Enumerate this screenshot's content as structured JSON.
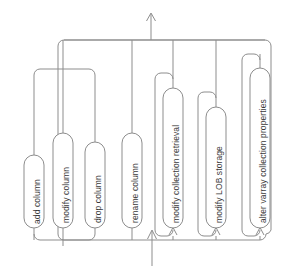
{
  "diagram": {
    "type": "railroad-syntax-diagram",
    "orientation": "vertical-rotated",
    "colors": {
      "line": "#8d8d8d",
      "node_fill": "#ffffff",
      "node_stroke": "#8d8d8d",
      "label_text": "#3a3a3a",
      "background": "#ffffff"
    },
    "entry": {
      "name": "entry-arrow",
      "direction": "up",
      "x": 152,
      "y_from": 266,
      "y_to": 229
    },
    "exit": {
      "name": "exit-arrow",
      "direction": "up",
      "x": 151,
      "y_from": 40,
      "y_to": 12
    },
    "nodes": [
      {
        "id": "add-column",
        "label": "add column",
        "x": 24,
        "y_top": 155,
        "y_bottom": 228,
        "width": 20,
        "rail_x": 34
      },
      {
        "id": "modify-column",
        "label": "modify column",
        "x": 53,
        "y_top": 133,
        "y_bottom": 228,
        "width": 20,
        "rail_x": 63
      },
      {
        "id": "drop-column",
        "label": "drop column",
        "x": 85,
        "y_top": 142,
        "y_bottom": 228,
        "width": 20,
        "rail_x": 95
      },
      {
        "id": "rename-column",
        "label": "rename column",
        "x": 122,
        "y_top": 133,
        "y_bottom": 228,
        "width": 20,
        "rail_x": 132
      },
      {
        "id": "modify-collection-retrieval",
        "label": "modify collection retrieval",
        "x": 163,
        "y_top": 88,
        "y_bottom": 228,
        "width": 20,
        "rail_x": 173
      },
      {
        "id": "modify-lob-storage",
        "label": "modify LOB storage",
        "x": 206,
        "y_top": 107,
        "y_bottom": 228,
        "width": 20,
        "rail_x": 216
      },
      {
        "id": "alter-varray-collection-properties",
        "label": "alter varray collection properties",
        "x": 250,
        "y_top": 68,
        "y_bottom": 228,
        "width": 20,
        "rail_x": 260
      }
    ],
    "rails": {
      "main_top_y": 40,
      "main_bottom_y": 229,
      "left_group_top_y": 69,
      "left_group_bottom_y": 240,
      "inner_bypass_y": 57,
      "outer_bypass_y": 48
    }
  }
}
